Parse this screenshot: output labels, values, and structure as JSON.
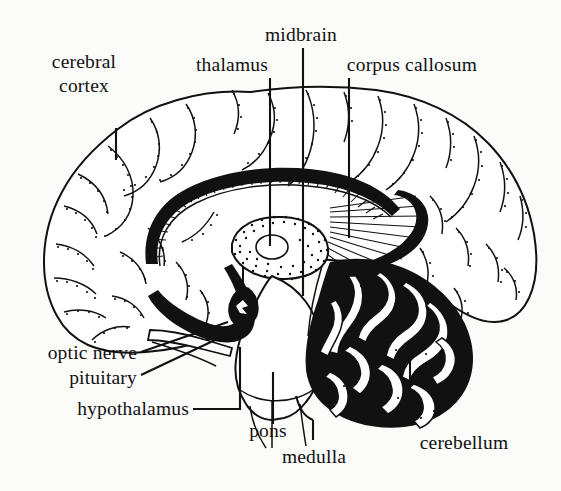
{
  "figure": {
    "background_color": "#fbfbfa",
    "ink_color": "#111111",
    "style": "black-and-white line drawing with stipple shading"
  },
  "labels": {
    "cerebral_cortex_line1": "cerebral",
    "cerebral_cortex_line2": "cortex",
    "thalamus": "thalamus",
    "midbrain": "midbrain",
    "corpus_callosum": "corpus callosum",
    "optic_nerve": "optic nerve",
    "pituitary": "pituitary",
    "hypothalamus": "hypothalamus",
    "pons": "pons",
    "medulla": "medulla",
    "cerebellum": "cerebellum"
  },
  "structures": [
    {
      "name": "cerebral cortex",
      "label": "cerebral cortex",
      "region": "outer convoluted surface, upper left and right"
    },
    {
      "name": "thalamus",
      "label": "thalamus",
      "region": "central stippled oval"
    },
    {
      "name": "midbrain",
      "label": "midbrain",
      "region": "upper brainstem"
    },
    {
      "name": "corpus callosum",
      "label": "corpus callosum",
      "region": "arched band above thalamus"
    },
    {
      "name": "optic nerve",
      "label": "optic nerve",
      "region": "lower anterior, projecting forward"
    },
    {
      "name": "pituitary",
      "label": "pituitary",
      "region": "small lobe below hypothalamus"
    },
    {
      "name": "hypothalamus",
      "label": "hypothalamus",
      "region": "below thalamus, above pituitary"
    },
    {
      "name": "pons",
      "label": "pons",
      "region": "bulge of brainstem"
    },
    {
      "name": "medulla",
      "label": "medulla",
      "region": "lowest brainstem segment"
    },
    {
      "name": "cerebellum",
      "label": "cerebellum",
      "region": "posterior-inferior, arbor vitae branching"
    }
  ]
}
